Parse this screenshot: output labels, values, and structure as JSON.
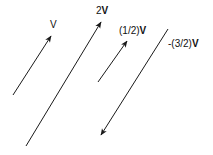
{
  "diagram": {
    "colors": {
      "stroke": "#1a1a1a",
      "background": "#ffffff"
    },
    "vectors": [
      {
        "id": "v",
        "label_prefix": "",
        "label_vec": "V",
        "vec_bold": false,
        "from": [
          13,
          95
        ],
        "to": [
          51,
          36
        ],
        "label_pos": [
          50,
          20
        ]
      },
      {
        "id": "2v",
        "label_prefix": "2",
        "label_vec": "V",
        "vec_bold": true,
        "from": [
          26,
          146
        ],
        "to": [
          101,
          22
        ],
        "label_pos": [
          96,
          6
        ]
      },
      {
        "id": "half-v",
        "label_prefix": "(1/2)",
        "label_vec": "V",
        "vec_bold": true,
        "from": [
          98,
          82
        ],
        "to": [
          127,
          41
        ],
        "label_pos": [
          119,
          26
        ]
      },
      {
        "id": "neg-3-2-v",
        "label_prefix": "-(3/2)",
        "label_vec": "V",
        "vec_bold": true,
        "from": [
          168,
          29
        ],
        "to": [
          101,
          135
        ],
        "label_pos": [
          168,
          39
        ]
      }
    ]
  }
}
